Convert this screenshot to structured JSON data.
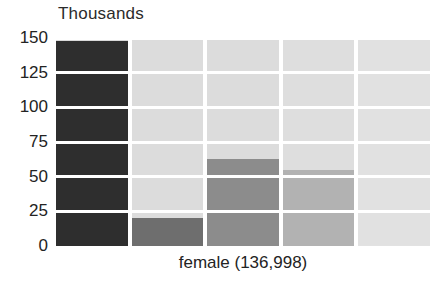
{
  "chart_data": {
    "type": "bar",
    "title": "Thousands",
    "xlabel": "female (136,998)",
    "ylabel": "",
    "categories": [
      "1",
      "2",
      "3",
      "4",
      "5"
    ],
    "values": [
      148,
      20,
      63,
      55,
      1
    ],
    "ylim": [
      0,
      150
    ],
    "yticks": [
      150,
      125,
      100,
      75,
      50,
      25,
      0
    ],
    "ytick_labels": [
      "150",
      "125",
      "100",
      "75",
      "50",
      "25",
      "0"
    ],
    "grid": true,
    "legend": "none",
    "bar_colors": [
      "#2e2e2e",
      "#6e6e6e",
      "#8c8c8c",
      "#b2b2b2",
      "#e2e2e2"
    ],
    "column_bg_colors": [
      "#d9d9d9",
      "#dcdcdc",
      "#dcdcdc",
      "#dedede",
      "#e1e1e1"
    ]
  },
  "colors": {
    "background": "#ffffff",
    "gridline": "#ffffff",
    "text": "#232323",
    "title_text": "#2b2b2b"
  }
}
